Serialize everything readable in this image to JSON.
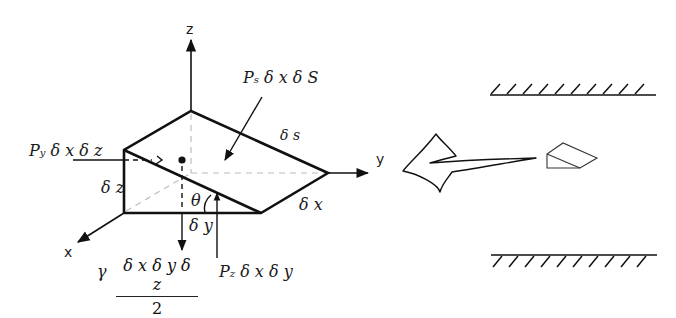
{
  "figure": {
    "axes": {
      "x": "x",
      "y": "y",
      "z": "z"
    },
    "dimensions": {
      "dz": "δ z",
      "dy": "δ y",
      "dx": "δ x",
      "ds": "δ s"
    },
    "angle": "θ",
    "forces": {
      "ps": {
        "symbol": "P",
        "sub": "s",
        "rest": " δ x δ S"
      },
      "py": {
        "symbol": "P",
        "sub": "y",
        "rest": " δ x δ z"
      },
      "pz": {
        "symbol": "P",
        "sub": "z",
        "rest": " δ x δ y"
      },
      "weight": {
        "coef": "γ",
        "numerator": "δ x δ y δ z",
        "denominator": "2"
      }
    },
    "inset": {
      "description": "Wedge element in flow between two walls",
      "walls": [
        "top-wall",
        "bottom-wall"
      ]
    },
    "colors": {
      "line": "#111111",
      "dashed": "#bbbbbb",
      "background": "#ffffff"
    }
  }
}
